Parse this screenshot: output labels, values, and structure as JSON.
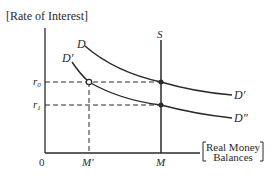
{
  "diagram": {
    "type": "money-market-diagram",
    "y_axis_label": "Rate of Interest",
    "x_axis_label_line1": "Real Money",
    "x_axis_label_line2": "Balances",
    "origin_label": "0",
    "interest_levels": [
      {
        "id": "r0",
        "label": "r",
        "subscript": "0"
      },
      {
        "id": "r1",
        "label": "r",
        "subscript": "1"
      }
    ],
    "quantity_levels": [
      {
        "id": "M_prime",
        "label": "M′"
      },
      {
        "id": "M",
        "label": "M"
      }
    ],
    "supply_curve": {
      "label": "S"
    },
    "demand_curves": [
      {
        "id": "D",
        "start_label": "D",
        "end_label": "D′"
      },
      {
        "id": "D_prime",
        "start_label": "D′",
        "end_label": "D″"
      }
    ],
    "points": [
      {
        "id": "intersection-D-r0-M",
        "description": "D meets S at r0"
      },
      {
        "id": "intersection-Dprime-r1-M",
        "description": "D′ meets S at r1"
      },
      {
        "id": "intersection-Dprime-r0-Mprime",
        "description": "D′ at r0, M′"
      }
    ],
    "colors": {
      "ink": "#2a2a2a",
      "background": "#ffffff"
    }
  }
}
